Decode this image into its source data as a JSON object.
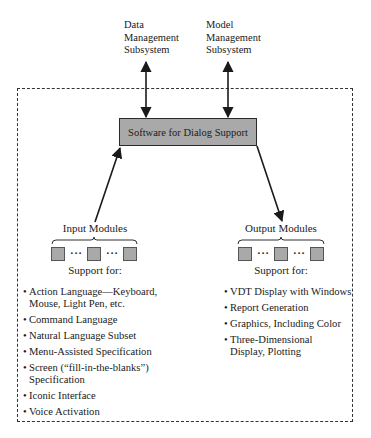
{
  "diagram": {
    "external_systems": [
      {
        "id": "data-management",
        "lines": [
          "Data",
          "Management",
          "Subsystem"
        ]
      },
      {
        "id": "model-management",
        "lines": [
          "Model",
          "Management",
          "Subsystem"
        ]
      }
    ],
    "core": {
      "label": "Software for Dialog Support",
      "fill": "#a9a9a9"
    },
    "input": {
      "title": "Input Modules",
      "ellipsis": "···",
      "support_label": "Support for:",
      "bullet": "•",
      "items": [
        {
          "lines": [
            "Action Language—Keyboard,",
            "Mouse, Light Pen, etc."
          ]
        },
        {
          "lines": [
            "Command Language"
          ]
        },
        {
          "lines": [
            "Natural Language Subset"
          ]
        },
        {
          "lines": [
            "Menu-Assisted Specification"
          ]
        },
        {
          "lines": [
            "Screen (“fill-in-the-blanks”)",
            "Specification"
          ]
        },
        {
          "lines": [
            "Iconic Interface"
          ]
        },
        {
          "lines": [
            "Voice Activation"
          ]
        }
      ]
    },
    "output": {
      "title": "Output Modules",
      "ellipsis": "···",
      "support_label": "Support for:",
      "bullet": "•",
      "items": [
        {
          "lines": [
            "VDT Display with Windows"
          ]
        },
        {
          "lines": [
            "Report Generation"
          ]
        },
        {
          "lines": [
            "Graphics, Including Color"
          ]
        },
        {
          "lines": [
            "Three-Dimensional",
            "Display, Plotting"
          ]
        }
      ]
    },
    "connections": [
      {
        "from": "data-management",
        "to": "core",
        "type": "bidirectional"
      },
      {
        "from": "model-management",
        "to": "core",
        "type": "bidirectional"
      },
      {
        "from": "input",
        "to": "core",
        "type": "directed"
      },
      {
        "from": "core",
        "to": "output",
        "type": "directed"
      }
    ],
    "colors": {
      "line": "#1a1a1a",
      "module_fill": "#a9a9a9",
      "boundary": "#333333"
    }
  }
}
